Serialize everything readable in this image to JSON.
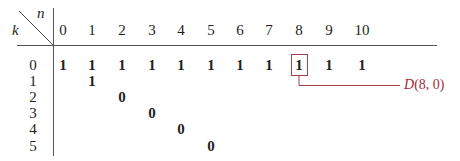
{
  "table": {
    "corner": {
      "col_var": "n",
      "row_var": "k"
    },
    "columns": [
      "0",
      "1",
      "2",
      "3",
      "4",
      "5",
      "6",
      "7",
      "8",
      "9",
      "10"
    ],
    "rows": [
      {
        "k": "0",
        "values": [
          "1",
          "1",
          "1",
          "1",
          "1",
          "1",
          "1",
          "1",
          "1",
          "1",
          "1"
        ]
      },
      {
        "k": "1",
        "values": [
          "",
          "1",
          "",
          "",
          "",
          "",
          "",
          "",
          "",
          "",
          ""
        ]
      },
      {
        "k": "2",
        "values": [
          "",
          "",
          "0",
          "",
          "",
          "",
          "",
          "",
          "",
          "",
          ""
        ]
      },
      {
        "k": "3",
        "values": [
          "",
          "",
          "",
          "0",
          "",
          "",
          "",
          "",
          "",
          "",
          ""
        ]
      },
      {
        "k": "4",
        "values": [
          "",
          "",
          "",
          "",
          "0",
          "",
          "",
          "",
          "",
          "",
          ""
        ]
      },
      {
        "k": "5",
        "values": [
          "",
          "",
          "",
          "",
          "",
          "0",
          "",
          "",
          "",
          "",
          ""
        ]
      }
    ]
  },
  "callout": {
    "label_func": "D",
    "label_args": "(8, 0)",
    "target": {
      "n": 8,
      "k": 0
    },
    "color": "#a0404a"
  }
}
